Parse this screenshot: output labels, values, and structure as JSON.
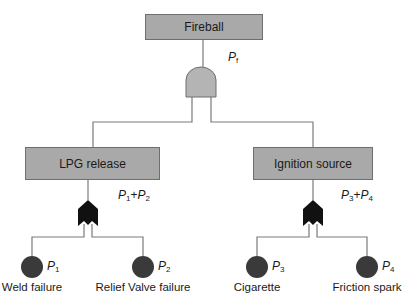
{
  "diagram": {
    "type": "fault-tree",
    "top_event": {
      "label": "Fireball",
      "probability": {
        "symbol": "P",
        "sub": "f"
      }
    },
    "top_gate": {
      "type": "AND"
    },
    "intermediate_events": [
      {
        "label": "LPG release",
        "gate": "OR",
        "probability": {
          "terms": [
            {
              "symbol": "P",
              "sub": "1"
            },
            {
              "symbol": "P",
              "sub": "2"
            }
          ],
          "operator": "+"
        }
      },
      {
        "label": "Ignition source",
        "gate": "OR",
        "probability": {
          "terms": [
            {
              "symbol": "P",
              "sub": "3"
            },
            {
              "symbol": "P",
              "sub": "4"
            }
          ],
          "operator": "+"
        }
      }
    ],
    "basic_events": [
      {
        "label": "Weld failure",
        "symbol": "P",
        "sub": "1"
      },
      {
        "label": "Relief Valve failure",
        "symbol": "P",
        "sub": "2"
      },
      {
        "label": "Cigarette",
        "symbol": "P",
        "sub": "3"
      },
      {
        "label": "Friction spark",
        "symbol": "P",
        "sub": "4"
      }
    ],
    "colors": {
      "box_fill": "#a9a9a9",
      "and_gate_fill": "#b4b4b4",
      "or_gate_fill": "#111111",
      "basic_event_fill": "#3a3a3a",
      "line": "#7a7a7a"
    }
  }
}
